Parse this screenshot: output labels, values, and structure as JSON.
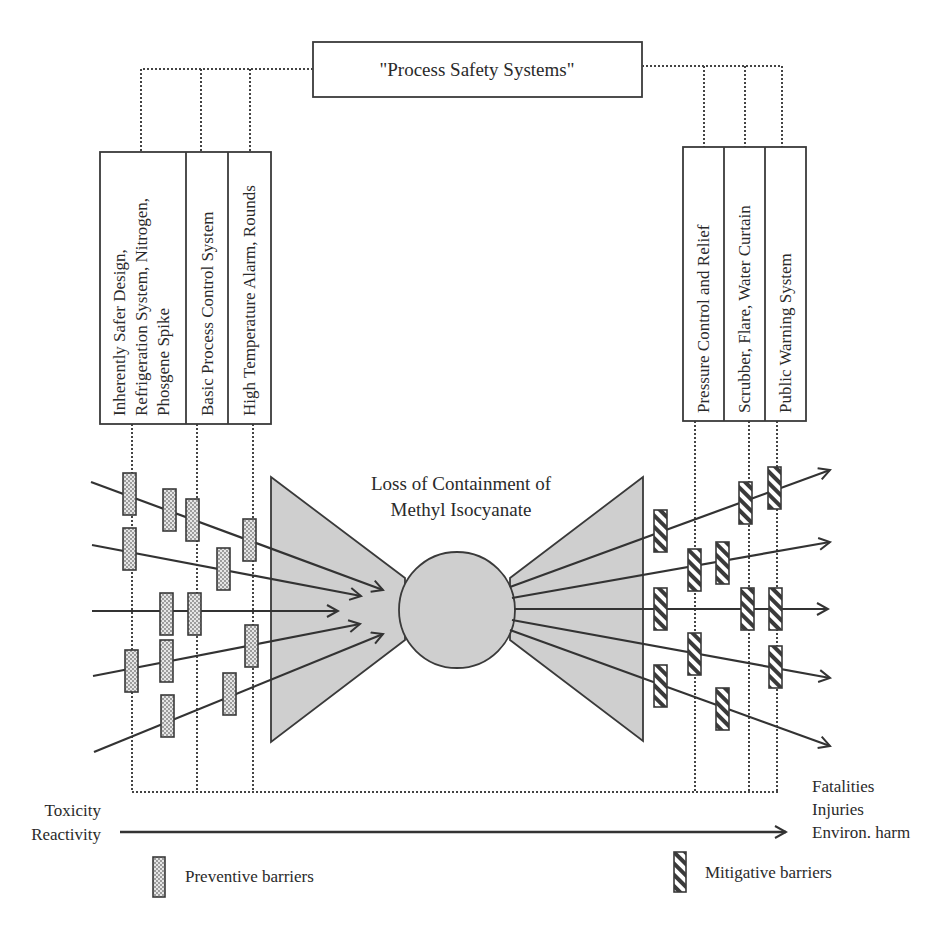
{
  "diagram": {
    "type": "bow-tie",
    "title_box": {
      "label": "\"Process Safety Systems\""
    },
    "top_event": {
      "line1": "Loss of Containment of",
      "line2": "Methyl Isocyanate"
    },
    "preventive_systems": [
      {
        "lines": [
          "Inherently Safer Design,",
          "Refrigeration System, Nitrogen,",
          "Phosgene Spike"
        ]
      },
      {
        "lines": [
          "Basic Process Control System"
        ]
      },
      {
        "lines": [
          "High Temperature Alarm, Rounds"
        ]
      }
    ],
    "mitigative_systems": [
      {
        "lines": [
          "Pressure Control and Relief"
        ]
      },
      {
        "lines": [
          "Scrubber, Flare, Water Curtain"
        ]
      },
      {
        "lines": [
          "Public Warning System"
        ]
      }
    ],
    "hazard_labels": {
      "line1": "Toxicity",
      "line2": "Reactivity"
    },
    "consequence_labels": {
      "line1": "Fatalities",
      "line2": "Injuries",
      "line3": "Environ. harm"
    },
    "legend": {
      "preventive": "Preventive barriers",
      "mitigative": "Mitigative barriers"
    },
    "colors": {
      "line": "#3a3a3a",
      "fill_gray": "#cfcfcf",
      "dotted": "#444444"
    }
  }
}
